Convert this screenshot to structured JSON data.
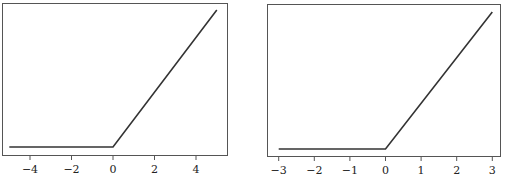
{
  "chart_data": [
    {
      "type": "line",
      "title": "",
      "xlabel": "",
      "ylabel": "",
      "function": "ReLU: y = max(0, x)",
      "x": [
        -5,
        0,
        5
      ],
      "y": [
        0,
        0,
        5
      ],
      "xlim": [
        -5.5,
        5.5
      ],
      "ylim": [
        -0.2,
        5.2
      ],
      "xticks": [
        -4,
        -2,
        0,
        2,
        4
      ],
      "xtick_labels": [
        "−4",
        "−2",
        "0",
        "2",
        "4"
      ],
      "yticks": [],
      "grid": false,
      "legend": null,
      "line_color": "#333333"
    },
    {
      "type": "line",
      "title": "",
      "xlabel": "",
      "ylabel": "",
      "function": "ReLU: y = max(0, x)",
      "x": [
        -3,
        0,
        3
      ],
      "y": [
        0,
        0,
        3
      ],
      "xlim": [
        -3.3,
        3.3
      ],
      "ylim": [
        -0.1,
        3.1
      ],
      "xticks": [
        -3,
        -2,
        -1,
        0,
        1,
        2,
        3
      ],
      "xtick_labels": [
        "−3",
        "−2",
        "−1",
        "0",
        "1",
        "2",
        "3"
      ],
      "yticks": [],
      "grid": false,
      "legend": null,
      "line_color": "#333333"
    }
  ]
}
